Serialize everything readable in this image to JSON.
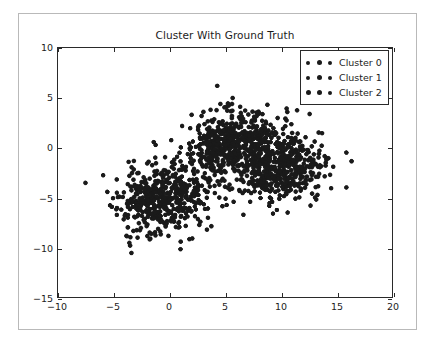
{
  "chart_data": {
    "type": "scatter",
    "title": "Cluster With Ground Truth",
    "xlabel": "",
    "ylabel": "",
    "xlim": [
      -10,
      20
    ],
    "ylim": [
      -15,
      10
    ],
    "xticks": [
      -10,
      -5,
      0,
      5,
      10,
      15,
      20
    ],
    "yticks": [
      10,
      5,
      0,
      -5,
      -10,
      -15
    ],
    "xtick_labels": [
      "−10",
      "−5",
      "0",
      "5",
      "10",
      "15",
      "20"
    ],
    "ytick_labels": [
      "10",
      "5",
      "0",
      "−5",
      "−10",
      "−15"
    ],
    "grid": false,
    "legend_position": "upper right",
    "marker": "circle",
    "marker_size": 4.2,
    "marker_color": "#1a1a1a",
    "background": "#ffffff",
    "frame_color": "#2a2a2a",
    "series": [
      {
        "name": "Cluster 0",
        "color": "#1a1a1a",
        "n_points": 500,
        "center": [
          -0.6,
          -5.0
        ],
        "spread": [
          2.0,
          1.8
        ],
        "seed": 11
      },
      {
        "name": "Cluster 1",
        "color": "#1a1a1a",
        "n_points": 500,
        "center": [
          5.6,
          0.6
        ],
        "spread": [
          1.9,
          1.5
        ],
        "seed": 29
      },
      {
        "name": "Cluster 2",
        "color": "#1a1a1a",
        "n_points": 500,
        "center": [
          10.0,
          -2.1
        ],
        "spread": [
          2.0,
          1.7
        ],
        "seed": 47
      }
    ],
    "notable_points": [
      {
        "x": 4.3,
        "y": 6.2,
        "note": "top outlier"
      },
      {
        "x": 1.0,
        "y": -10.2,
        "note": "bottom outlier"
      },
      {
        "x": 15.9,
        "y": -0.5,
        "note": "right outlier"
      },
      {
        "x": 15.9,
        "y": -4.0,
        "note": "right outlier"
      },
      {
        "x": -3.5,
        "y": -9.0,
        "note": "lower-left outlier"
      }
    ]
  },
  "legend": {
    "entries": [
      {
        "label": "Cluster 0"
      },
      {
        "label": "Cluster 1"
      },
      {
        "label": "Cluster 2"
      }
    ]
  }
}
